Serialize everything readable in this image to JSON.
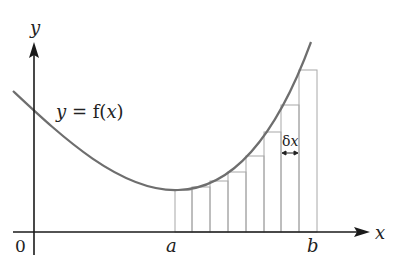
{
  "labels": {
    "y_axis": "y",
    "x_axis": "x",
    "origin": "0",
    "a": "a",
    "b": "b",
    "curve_prefix": "y",
    "curve_eq": " = f(",
    "curve_var": "x",
    "curve_close": ")",
    "delta_d": "δ",
    "delta_x": "x"
  },
  "colors": {
    "axis": "#1a1a1a",
    "curve": "#6e6e6e",
    "rect": "#a8a8a8",
    "text": "#222222"
  },
  "diagram": {
    "type": "riemann-sum",
    "num_rectangles": 8,
    "rect_edges_px": [
      175,
      192,
      210,
      228,
      246,
      264,
      281,
      299,
      317
    ],
    "rect_tops_px": [
      190,
      187,
      181,
      172,
      156,
      132,
      105,
      70
    ]
  }
}
